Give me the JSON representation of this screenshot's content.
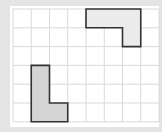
{
  "diagram": {
    "type": "grid-shapes",
    "grid": {
      "columns": 8,
      "rows": 6,
      "origin_x": 13,
      "origin_y": 9,
      "cell_w": 18.25,
      "cell_h": 18.8,
      "line_color": "#d9d9d9",
      "background": "#ffffff"
    },
    "shapes": [
      {
        "name": "top-l-shape",
        "fill": "#ebebeb",
        "stroke": "#333333",
        "cells_outline": [
          [
            4,
            0
          ],
          [
            7,
            0
          ],
          [
            7,
            2
          ],
          [
            6,
            2
          ],
          [
            6,
            1
          ],
          [
            4,
            1
          ]
        ]
      },
      {
        "name": "bottom-l-shape",
        "fill": "#d4d4d4",
        "stroke": "#333333",
        "cells_outline": [
          [
            1,
            3
          ],
          [
            2,
            3
          ],
          [
            2,
            5
          ],
          [
            3,
            5
          ],
          [
            3,
            6
          ],
          [
            1,
            6
          ]
        ]
      }
    ]
  }
}
